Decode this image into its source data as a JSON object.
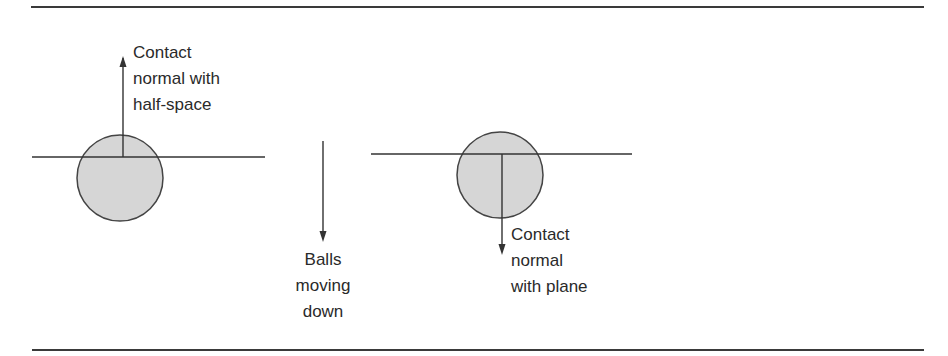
{
  "colors": {
    "line": "#333333",
    "ball_fill": "#d6d6d6",
    "ball_stroke": "#444444",
    "text": "#2a2a2a"
  },
  "rules": {
    "top": {
      "x1": 31,
      "x2": 924,
      "y": 7
    },
    "bottom": {
      "x1": 32,
      "x2": 924,
      "y": 350
    }
  },
  "left_scene": {
    "plane": {
      "x1": 32,
      "x2": 265,
      "y": 157
    },
    "ball": {
      "cx": 120,
      "cy": 178,
      "r": 43
    },
    "normal_arrow": {
      "x": 123,
      "y_start": 157,
      "y_tip": 57,
      "direction": "up"
    },
    "label": {
      "lines": [
        "Contact",
        "normal with",
        "half-space"
      ],
      "x": 133,
      "y": 40
    }
  },
  "middle": {
    "motion_arrow": {
      "x": 323,
      "y_start": 141,
      "y_tip": 241,
      "direction": "down"
    },
    "label": {
      "lines": [
        "Balls",
        "moving",
        "down"
      ],
      "x": 323,
      "y": 247
    }
  },
  "right_scene": {
    "plane": {
      "x1": 371,
      "x2": 632,
      "y": 154
    },
    "ball": {
      "cx": 500,
      "cy": 175,
      "r": 43
    },
    "normal_arrow": {
      "x": 502,
      "y_start": 154,
      "y_tip": 254,
      "direction": "down"
    },
    "label": {
      "lines": [
        "Contact",
        "normal",
        "with plane"
      ],
      "x": 511,
      "y": 222
    }
  }
}
